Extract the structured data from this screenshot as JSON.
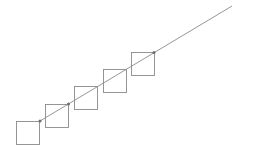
{
  "diagram": {
    "square_count": 5,
    "dots_on_squares": [
      1,
      2,
      5
    ],
    "colors": {
      "background": "#ffffff",
      "square_stroke": "#8a8a8a",
      "line_stroke": "#8a8a8a",
      "dot_fill": "#6f6f6f"
    }
  }
}
